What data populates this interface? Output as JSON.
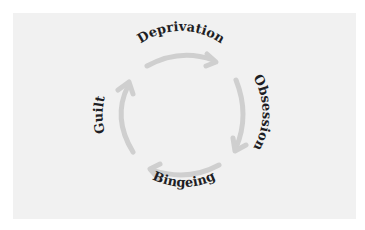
{
  "diagram": {
    "type": "cycle",
    "colors": {
      "background": "#f1f1f1",
      "arrow": "#cfcfcf",
      "text": "#1e1e24"
    },
    "stages": [
      {
        "label": "Deprivation",
        "position": "top"
      },
      {
        "label": "Obsession",
        "position": "right"
      },
      {
        "label": "Bingeing",
        "position": "bottom"
      },
      {
        "label": "Guilt",
        "position": "left"
      }
    ],
    "flow": [
      "Deprivation",
      "Obsession",
      "Bingeing",
      "Guilt",
      "Deprivation"
    ],
    "direction": "clockwise"
  }
}
